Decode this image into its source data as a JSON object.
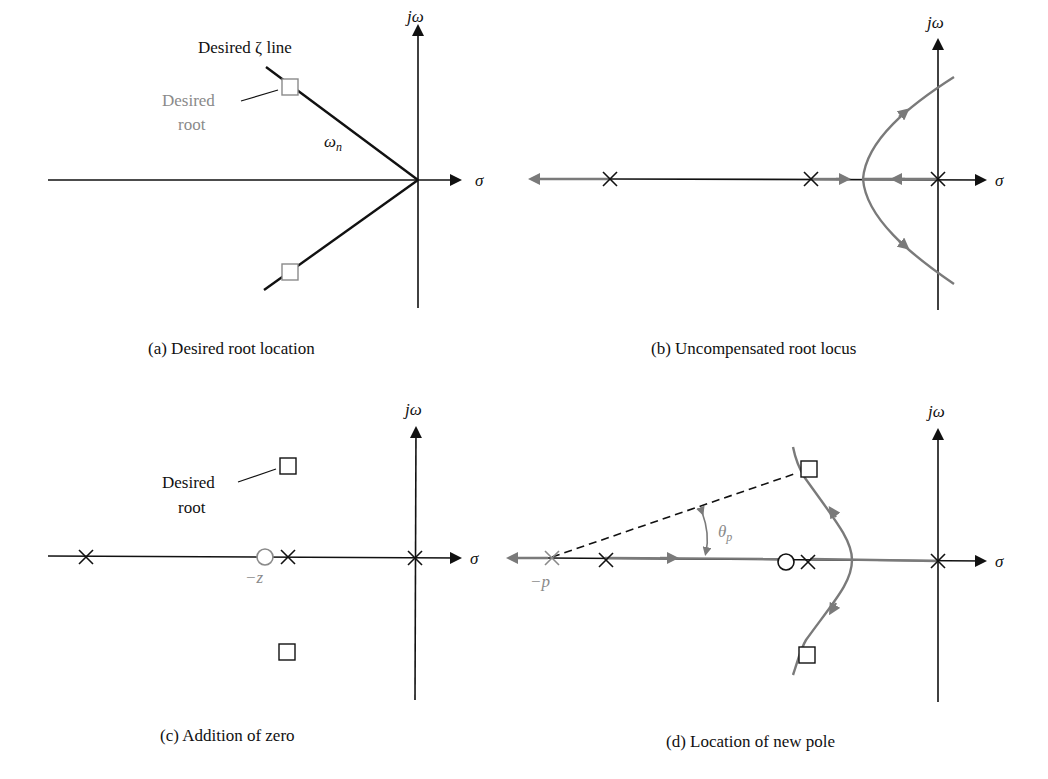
{
  "figure": {
    "panels": [
      {
        "id": "a",
        "caption": "(a)  Desired root location",
        "axis_labels": {
          "imag": "jω",
          "real": "σ"
        },
        "annotations": {
          "zeta_line": "Desired ζ line",
          "desired_root_line1": "Desired",
          "desired_root_line2": "root",
          "omega_n": "ω",
          "omega_n_sub": "n"
        }
      },
      {
        "id": "b",
        "caption": "(b)  Uncompensated root locus",
        "axis_labels": {
          "imag": "jω",
          "real": "σ"
        }
      },
      {
        "id": "c",
        "caption": "(c)  Addition of zero",
        "axis_labels": {
          "imag": "jω",
          "real": "σ"
        },
        "annotations": {
          "desired_root_line1": "Desired",
          "desired_root_line2": "root",
          "zero_label": "−z"
        }
      },
      {
        "id": "d",
        "caption": "(d)  Location of new pole",
        "axis_labels": {
          "imag": "jω",
          "real": "σ"
        },
        "annotations": {
          "pole_label": "−p",
          "theta": "θ",
          "theta_sub": "p"
        }
      }
    ],
    "colors": {
      "axis": "#111111",
      "locus": "#7a7a7a",
      "highlight_gray": "#8a8a8a"
    }
  }
}
